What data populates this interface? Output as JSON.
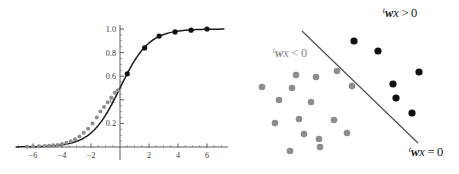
{
  "figure": {
    "panels": [
      {
        "name": "sigmoid-curve-panel",
        "position": "left"
      },
      {
        "name": "decision-boundary-panel",
        "position": "right"
      }
    ]
  },
  "chart_data": [
    {
      "type": "line",
      "name": "logistic-sigmoid",
      "title": "",
      "xlabel": "",
      "ylabel": "",
      "xlim": [
        -7.2,
        7.2
      ],
      "ylim": [
        -0.04,
        1.06
      ],
      "xticks": [
        -6,
        -4,
        -2,
        2,
        4,
        6
      ],
      "xtick_labels": [
        "-6",
        "-4",
        "-2",
        "2",
        "4",
        "6"
      ],
      "yticks": [
        0.2,
        0.4,
        0.6,
        0.8,
        1.0
      ],
      "ytick_labels": [
        "0.2",
        "0.",
        "0.6",
        "0.8",
        "1.0"
      ],
      "minor_tick_step": 0.4,
      "grid": false,
      "legend": "none",
      "series": [
        {
          "name": "sigmoid-line",
          "color": "#1a1a1a",
          "formula": "1 / (1 + exp(-x))",
          "x": [
            -7.2,
            -6.6,
            -6.0,
            -5.4,
            -4.8,
            -4.2,
            -3.6,
            -3.0,
            -2.4,
            -1.8,
            -1.2,
            -0.6,
            0.0,
            0.6,
            1.2,
            1.8,
            2.4,
            3.0,
            3.6,
            4.2,
            4.8,
            5.4,
            6.0,
            6.6,
            7.2
          ],
          "y": [
            0.001,
            0.001,
            0.002,
            0.004,
            0.008,
            0.015,
            0.027,
            0.047,
            0.083,
            0.142,
            0.231,
            0.354,
            0.5,
            0.646,
            0.769,
            0.858,
            0.917,
            0.953,
            0.973,
            0.985,
            0.992,
            0.995,
            0.998,
            0.999,
            0.999
          ]
        },
        {
          "name": "positive-class-points",
          "color": "#111111",
          "marker": "filled-circle",
          "x": [
            0.5,
            1.7,
            2.7,
            3.8,
            4.9,
            6.0
          ],
          "y": [
            0.62,
            0.84,
            0.94,
            0.975,
            0.99,
            1.0
          ]
        },
        {
          "name": "negative-class-points",
          "color": "#8d8d8d",
          "marker": "filled-circle",
          "x": [
            -6.4,
            -6.0,
            -5.6,
            -5.2,
            -4.9,
            -4.6,
            -4.3,
            -4.0,
            -3.7,
            -3.4,
            -3.1,
            -2.8,
            -2.5,
            -2.2,
            -1.9,
            -1.6,
            -1.35,
            -1.1,
            -0.85,
            -0.6,
            -0.35,
            -0.15
          ],
          "y": [
            0.003,
            0.004,
            0.006,
            0.008,
            0.011,
            0.014,
            0.018,
            0.025,
            0.035,
            0.048,
            0.065,
            0.09,
            0.12,
            0.155,
            0.2,
            0.25,
            0.3,
            0.34,
            0.38,
            0.42,
            0.46,
            0.48
          ]
        }
      ]
    },
    {
      "type": "scatter",
      "name": "linear-decision-boundary",
      "title": "",
      "xlabel": "",
      "ylabel": "",
      "grid": false,
      "legend": "none",
      "axes_visible": false,
      "annotations": [
        {
          "name": "positive-region-label",
          "text": "wx > 0",
          "prime": "t",
          "color": "#1a1a1a",
          "x": 400,
          "y": 17
        },
        {
          "name": "negative-region-label",
          "text": "wx < 0",
          "prime": "t",
          "color": "#8d8d8d",
          "x": 290,
          "y": 57
        },
        {
          "name": "boundary-label",
          "text": "wx = 0",
          "prime": "t",
          "color": "#1a1a1a",
          "x": 426,
          "y": 156
        }
      ],
      "boundary_line": {
        "name": "separating-hyperplane",
        "color": "#4a4a4a",
        "x1": 302,
        "y1": 31,
        "x2": 418,
        "y2": 143
      },
      "series": [
        {
          "name": "positive-class-points",
          "color": "#111111",
          "marker": "filled-circle",
          "points": [
            [
              354,
              41
            ],
            [
              378,
              51
            ],
            [
              419,
              72
            ],
            [
              393,
              84
            ],
            [
              396,
              98
            ],
            [
              412,
              113
            ]
          ]
        },
        {
          "name": "negative-class-points",
          "color": "#8d8d8d",
          "marker": "filled-circle",
          "points": [
            [
              296,
              75
            ],
            [
              316,
              77
            ],
            [
              337,
              71
            ],
            [
              262,
              87
            ],
            [
              292,
              88
            ],
            [
              352,
              86
            ],
            [
              279,
              100
            ],
            [
              311,
              102
            ],
            [
              275,
              123
            ],
            [
              299,
              119
            ],
            [
              334,
              120
            ],
            [
              304,
              134
            ],
            [
              347,
              133
            ],
            [
              319,
              139
            ],
            [
              290,
              151
            ],
            [
              320,
              147
            ]
          ]
        }
      ]
    }
  ]
}
